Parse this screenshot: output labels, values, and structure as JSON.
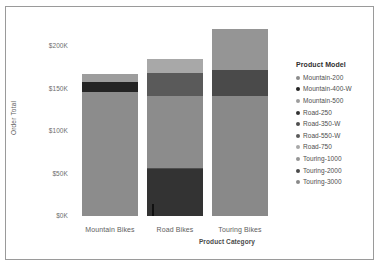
{
  "chart_data": {
    "type": "bar",
    "title": "",
    "subtitle": "",
    "stacked": true,
    "orientation": "vertical",
    "xlabel": "Product Category",
    "ylabel": "Order Total",
    "categories": [
      "Mountain Bikes",
      "Road Bikes",
      "Touring Bikes"
    ],
    "ytick_labels": [
      "$0K",
      "$50K",
      "$100K",
      "$150K",
      "$200K"
    ],
    "ytick_values": [
      0,
      50000,
      100000,
      150000,
      200000
    ],
    "ylim": [
      0,
      208000
    ],
    "grid": false,
    "legend_position": "right",
    "legend_title": "Product Model",
    "series": [
      {
        "name": "Mountain-200",
        "color": "#8c8c8c",
        "values": [
          146000,
          0,
          0
        ]
      },
      {
        "name": "Mountain-400-W",
        "color": "#242424",
        "values": [
          12000,
          0,
          0
        ]
      },
      {
        "name": "Mountain-500",
        "color": "#9d9d9d",
        "values": [
          9000,
          0,
          0
        ]
      },
      {
        "name": "Road-250",
        "color": "#333333",
        "values": [
          0,
          55000,
          0
        ]
      },
      {
        "name": "Road-350-W",
        "color": "#4f4f4f",
        "values": [
          0,
          1500,
          0
        ]
      },
      {
        "name": "Road-550-W",
        "color": "#8c8c8c",
        "values": [
          0,
          85000,
          0
        ]
      },
      {
        "name": "Road-750",
        "color": "#5a5a5a",
        "values": [
          0,
          27000,
          0
        ]
      },
      {
        "name": "Touring-1000",
        "color": "#a8a8a8",
        "values": [
          0,
          16000,
          0
        ]
      },
      {
        "name": "Touring-2000",
        "color": "#4a4a4a",
        "values": [
          0,
          0,
          31000
        ]
      },
      {
        "name": "Touring-3000",
        "color": "#898989",
        "values": [
          0,
          0,
          189000
        ]
      }
    ],
    "category_totals": [
      167000,
      184000,
      220000
    ],
    "bars": [
      {
        "category": "Mountain Bikes",
        "total": 167000,
        "segments": [
          {
            "model": "Mountain-200",
            "value": 146000,
            "color": "#8c8c8c"
          },
          {
            "model": "Mountain-400-W",
            "value": 12000,
            "color": "#242424"
          },
          {
            "model": "Mountain-500",
            "value": 9000,
            "color": "#9d9d9d"
          }
        ]
      },
      {
        "category": "Road Bikes",
        "total": 184000,
        "segments": [
          {
            "model": "Road-250",
            "value": 55000,
            "color": "#333333"
          },
          {
            "model": "Road-350-W",
            "value": 1500,
            "color": "#4f4f4f"
          },
          {
            "model": "Road-550-W",
            "value": 85000,
            "color": "#8c8c8c"
          },
          {
            "model": "Road-750",
            "value": 27000,
            "color": "#5a5a5a"
          },
          {
            "model": "Touring-1000",
            "value": 16000,
            "color": "#a8a8a8"
          }
        ]
      },
      {
        "category": "Touring Bikes",
        "total": 220000,
        "segments": [
          {
            "model": "Touring-3000",
            "value": 141000,
            "color": "#898989"
          },
          {
            "model": "Touring-2000",
            "value": 31000,
            "color": "#4a4a4a"
          },
          {
            "model": "Touring-1000",
            "value": 48000,
            "color": "#959595"
          }
        ]
      }
    ]
  },
  "legend": {
    "title": "Product Model",
    "items": [
      {
        "label": "Mountain-200",
        "color": "#8c8c8c"
      },
      {
        "label": "Mountain-400-W",
        "color": "#242424"
      },
      {
        "label": "Mountain-500",
        "color": "#9d9d9d"
      },
      {
        "label": "Road-250",
        "color": "#333333"
      },
      {
        "label": "Road-350-W",
        "color": "#4f4f4f"
      },
      {
        "label": "Road-550-W",
        "color": "#5a5a5a"
      },
      {
        "label": "Road-750",
        "color": "#a8a8a8"
      },
      {
        "label": "Touring-1000",
        "color": "#959595"
      },
      {
        "label": "Touring-2000",
        "color": "#4a4a4a"
      },
      {
        "label": "Touring-3000",
        "color": "#898989"
      }
    ]
  },
  "axes": {
    "y_title": "Order Total",
    "x_title": "Product Category"
  },
  "colors": {
    "background": "#ffffff",
    "frame": "#9a9a9a",
    "tick_text": "#6d6d6d",
    "axis_title": "#4a4a4a"
  }
}
